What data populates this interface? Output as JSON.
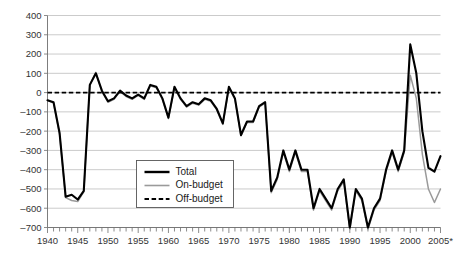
{
  "chart_data": {
    "type": "line",
    "title": "",
    "subtitle": "",
    "xlabel": "",
    "ylabel": "",
    "xlim": [
      1940,
      2005
    ],
    "ylim": [
      -700,
      400
    ],
    "grid": true,
    "legend_position": "inside-lower-left",
    "y_ticks": [
      400,
      300,
      200,
      100,
      0,
      -100,
      -200,
      -300,
      -400,
      -500,
      -600,
      -700
    ],
    "y_tick_labels": [
      "400",
      "300",
      "200",
      "100",
      "0",
      "–100",
      "–200",
      "–300",
      "–400",
      "–500",
      "–600",
      "–700"
    ],
    "x_ticks": [
      1940,
      1945,
      1950,
      1955,
      1960,
      1965,
      1970,
      1975,
      1980,
      1985,
      1990,
      1995,
      2000,
      2005
    ],
    "x_tick_labels": [
      "1940",
      "1945",
      "1950",
      "1955",
      "1960",
      "1965",
      "1970",
      "1975",
      "1980",
      "1985",
      "1990",
      "1995",
      "2000",
      "2005*"
    ],
    "x_minor_tick_interval": 1,
    "x": [
      1940,
      1941,
      1942,
      1943,
      1944,
      1945,
      1946,
      1947,
      1948,
      1949,
      1950,
      1951,
      1952,
      1953,
      1954,
      1955,
      1956,
      1957,
      1958,
      1959,
      1960,
      1961,
      1962,
      1963,
      1964,
      1965,
      1966,
      1967,
      1968,
      1969,
      1970,
      1971,
      1972,
      1973,
      1974,
      1975,
      1976,
      1977,
      1978,
      1979,
      1980,
      1981,
      1982,
      1983,
      1984,
      1985,
      1986,
      1987,
      1988,
      1989,
      1990,
      1991,
      1992,
      1993,
      1994,
      1995,
      1996,
      1997,
      1998,
      1999,
      2000,
      2001,
      2002,
      2003,
      2004,
      2005
    ],
    "series": [
      {
        "name": "Total",
        "style": "solid-thick-black",
        "color": "#000000",
        "values": [
          -40,
          -50,
          -210,
          -540,
          -530,
          -555,
          -510,
          40,
          100,
          10,
          -45,
          -30,
          10,
          -15,
          -30,
          -10,
          -30,
          40,
          30,
          -30,
          -130,
          30,
          -30,
          -70,
          -50,
          -60,
          -30,
          -40,
          -85,
          -160,
          30,
          -30,
          -220,
          -150,
          -150,
          -70,
          -50,
          -510,
          -440,
          -300,
          -400,
          -300,
          -400,
          -400,
          -600,
          -500,
          -550,
          -600,
          -500,
          -450,
          -700,
          -500,
          -550,
          -700,
          -600,
          -550,
          -400,
          -300,
          -400,
          -300,
          250,
          100,
          -200,
          -390,
          -410,
          -330
        ]
      },
      {
        "name": "On-budget",
        "style": "solid-thin-gray",
        "color": "#9a9a9a",
        "values": [
          -40,
          -55,
          -215,
          -545,
          -560,
          -565,
          -515,
          40,
          105,
          5,
          -50,
          -35,
          5,
          -20,
          -35,
          -15,
          -35,
          35,
          25,
          -35,
          -135,
          25,
          -35,
          -75,
          -55,
          -65,
          -35,
          -45,
          -90,
          -165,
          25,
          -35,
          -225,
          -155,
          -155,
          -75,
          -55,
          -520,
          -450,
          -310,
          -410,
          -310,
          -410,
          -410,
          -610,
          -510,
          -560,
          -610,
          -510,
          -460,
          -710,
          -510,
          -560,
          -710,
          -610,
          -560,
          -410,
          -310,
          -410,
          -310,
          90,
          -30,
          -320,
          -500,
          -570,
          -500
        ]
      },
      {
        "name": "Off-budget",
        "style": "dashed-black",
        "color": "#000000",
        "values": [
          0,
          0,
          0,
          0,
          0,
          0,
          0,
          0,
          0,
          0,
          0,
          0,
          0,
          0,
          0,
          0,
          0,
          0,
          0,
          0,
          0,
          0,
          0,
          0,
          0,
          0,
          0,
          0,
          0,
          0,
          0,
          0,
          0,
          0,
          0,
          0,
          0,
          0,
          0,
          0,
          0,
          0,
          0,
          0,
          0,
          0,
          0,
          0,
          0,
          0,
          0,
          0,
          0,
          0,
          0,
          0,
          0,
          0,
          0,
          0,
          0,
          0,
          0,
          0,
          0,
          0
        ]
      }
    ],
    "series_exact": {
      "Total": [
        -40,
        -50,
        -210,
        -540,
        -530,
        -555,
        -510,
        40,
        100,
        10,
        -45,
        -30,
        10,
        -15,
        -30,
        -10,
        -30,
        40,
        30,
        -30,
        -130,
        30,
        -30,
        -70,
        -50,
        -60,
        -30,
        -40,
        -85,
        -160,
        30,
        -30,
        -220,
        -150,
        -150,
        -70,
        -50,
        -510,
        -440,
        -300,
        -400,
        -300,
        -400,
        -400,
        -600,
        -500,
        -550,
        -600,
        -500,
        -450,
        -700,
        -500,
        -550,
        -700,
        -600,
        -550,
        -400,
        -300,
        -400,
        -300,
        250,
        100,
        -200,
        -390,
        -410,
        -330
      ]
    },
    "annotations": [
      "2005 value is marked with an asterisk (*) indicating estimate"
    ]
  },
  "legend": {
    "items": [
      {
        "label": "Total",
        "swatch": "solid-thick-black"
      },
      {
        "label": "On-budget",
        "swatch": "solid-thin-gray"
      },
      {
        "label": "Off-budget",
        "swatch": "dashed-black"
      }
    ]
  },
  "colors": {
    "total": "#000000",
    "onbudget": "#9a9a9a",
    "offbudget": "#000000",
    "gridline": "#b4b4b4",
    "axis": "#6e6e6e",
    "background": "#ffffff"
  }
}
